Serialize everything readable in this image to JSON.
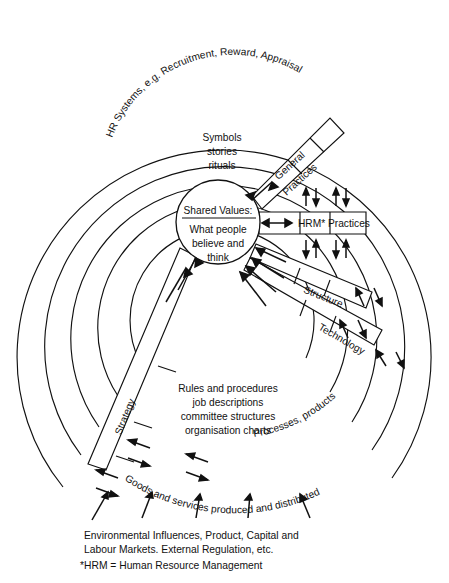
{
  "diagram": {
    "center": {
      "heading": "Shared Values:",
      "line1": "What people",
      "line2": "believe and",
      "line3": "think"
    },
    "inner_block": {
      "line1": "Symbols",
      "line2": "stories",
      "line3": "rituals"
    },
    "rules_block": {
      "line1": "Rules and procedures",
      "line2": "job descriptions",
      "line3": "committee structures",
      "line4": "organisation charts"
    },
    "ring_labels": {
      "hr_systems": "HR Systems, e.g. Recruitment, Reward, Appraisal",
      "goods": "Goods and services produced and distributed",
      "processes": "Processes, products"
    },
    "corridor_labels": {
      "general_practices_l1": "General",
      "general_practices_l2": "Practices",
      "hrm_practices": "HRM* Practices",
      "structure": "Structure",
      "technology": "Technology",
      "strategy": "Strategy"
    },
    "footer": {
      "line1": "Environmental Influences, Product, Capital and",
      "line2": "Labour Markets. External Regulation, etc.",
      "line3": "*HRM = Human Resource Management"
    },
    "colors": {
      "ink": "#111111",
      "paper": "#ffffff"
    }
  }
}
